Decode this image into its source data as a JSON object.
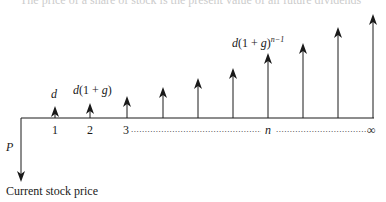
{
  "diagram": {
    "type": "cash-flow-timeline",
    "top_clipped_text": "The price of a share of stock is the present value of all future dividends",
    "labels": {
      "d": "d",
      "d1": "d(1 + g)",
      "dn_base": "d(1 + g)",
      "dn_exp": "n−1",
      "P": "P",
      "caption": "Current stock price"
    },
    "ticks": [
      "1",
      "2",
      "3",
      "n",
      "∞"
    ],
    "dots_1": "................................................",
    "dots_2": "...........................................",
    "arrows": [
      {
        "x": 55,
        "top": 106
      },
      {
        "x": 90,
        "top": 103
      },
      {
        "x": 127,
        "top": 96
      },
      {
        "x": 163,
        "top": 87
      },
      {
        "x": 198,
        "top": 78
      },
      {
        "x": 233,
        "top": 68
      },
      {
        "x": 268,
        "top": 53
      },
      {
        "x": 303,
        "top": 43
      },
      {
        "x": 338,
        "top": 27
      },
      {
        "x": 373,
        "top": 14
      }
    ],
    "colors": {
      "line": "#1a1a1a",
      "text": "#1a1a1a",
      "background": "#ffffff"
    }
  }
}
